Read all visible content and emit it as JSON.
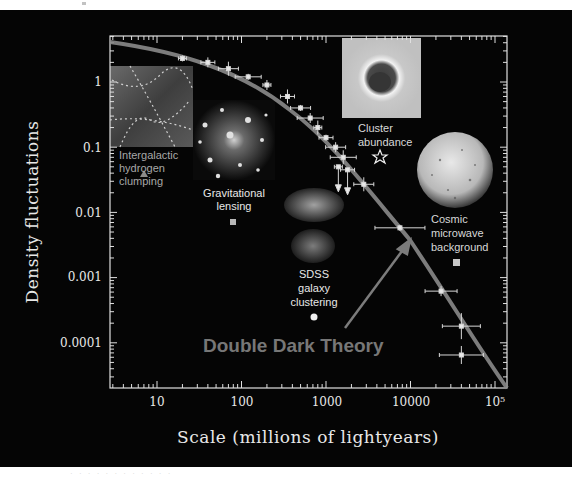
{
  "chart_data": {
    "type": "scatter",
    "title": "",
    "xlabel": "Scale (millions of lightyears)",
    "ylabel": "Density fluctuations",
    "xscale": "log",
    "yscale": "log",
    "xlim": [
      2.8,
      140000
    ],
    "ylim": [
      2e-05,
      5
    ],
    "x_ticks": [
      "10",
      "100",
      "1000",
      "10000",
      "10⁵"
    ],
    "y_ticks": [
      "1",
      "0.1",
      "0.01",
      "0.001",
      "0.0001"
    ],
    "grid": false,
    "annotation": "Double Dark Theory",
    "series": [
      {
        "name": "Double Dark Theory (model curve)",
        "type": "line",
        "x": [
          2.8,
          10,
          50,
          150,
          400,
          1000,
          2000,
          5000,
          10000,
          30000,
          140000
        ],
        "y": [
          4.6,
          3.2,
          1.6,
          0.8,
          0.3,
          0.1,
          0.04,
          0.012,
          0.004,
          0.0007,
          2e-05
        ]
      },
      {
        "name": "Intergalactic hydrogen clumping",
        "marker": "triangle",
        "x": [
          7
        ],
        "y": [
          0.014
        ]
      },
      {
        "name": "Gravitational lensing",
        "marker": "square",
        "x": [
          85
        ],
        "y": [
          0.0075
        ]
      },
      {
        "name": "SDSS galaxy clustering",
        "marker": "circle",
        "x": [
          700
        ],
        "y": [
          0.00019
        ]
      },
      {
        "name": "Cluster abundance",
        "marker": "star",
        "x": [
          4500
        ],
        "y": [
          0.07
        ]
      },
      {
        "name": "Cosmic microwave background",
        "marker": "square",
        "x": [
          40000
        ],
        "y": [
          0.0024
        ]
      },
      {
        "name": "Measurements",
        "type": "errorbar",
        "points": [
          {
            "x": 20,
            "y": 2.3
          },
          {
            "x": 40,
            "y": 2.0
          },
          {
            "x": 70,
            "y": 1.6
          },
          {
            "x": 120,
            "y": 1.2
          },
          {
            "x": 200,
            "y": 0.9
          },
          {
            "x": 350,
            "y": 0.6
          },
          {
            "x": 500,
            "y": 0.4
          },
          {
            "x": 650,
            "y": 0.28
          },
          {
            "x": 800,
            "y": 0.2
          },
          {
            "x": 1000,
            "y": 0.14
          },
          {
            "x": 1300,
            "y": 0.1
          },
          {
            "x": 1600,
            "y": 0.07
          },
          {
            "x": 1400,
            "y": 0.05,
            "upper_limit": true
          },
          {
            "x": 1800,
            "y": 0.045,
            "upper_limit": true
          },
          {
            "x": 2800,
            "y": 0.027
          },
          {
            "x": 7500,
            "y": 0.0058
          },
          {
            "x": 23000,
            "y": 0.00062
          },
          {
            "x": 40000,
            "y": 0.00018
          },
          {
            "x": 40000,
            "y": 6.5e-05
          }
        ]
      }
    ]
  },
  "labels": {
    "y_axis": "Density fluctuations",
    "x_axis": "Scale (millions of lightyears)",
    "theory": "Double Dark Theory",
    "hydrogen": [
      "Intergalactic",
      "hydrogen",
      "clumping"
    ],
    "lensing": [
      "Gravitational",
      "lensing"
    ],
    "sdss": [
      "SDSS",
      "galaxy",
      "clustering"
    ],
    "cluster": [
      "Cluster",
      "abundance"
    ],
    "cmb": [
      "Cosmic",
      "microwave",
      "background"
    ],
    "ticks_x": [
      "10",
      "100",
      "1000",
      "10000",
      "10⁵"
    ],
    "ticks_y": [
      "1",
      "0.1",
      "0.01",
      "0.001",
      "0.0001"
    ]
  },
  "caption": "· ·  · · ·   ·    ·        · · · · ·"
}
